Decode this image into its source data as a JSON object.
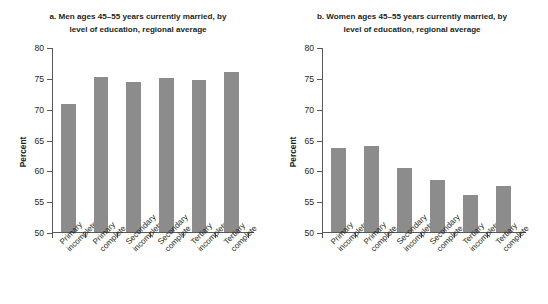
{
  "figure": {
    "super_title": "Latin America and the Caribbean",
    "bar_color": "#8c8c8c",
    "axis_color": "#58585a"
  },
  "panels": [
    {
      "id": "panel-a",
      "title_line1": "a. Men ages 45–55 years currently married, by",
      "title_line2": "level of education, regional average",
      "ylabel": "Percent"
    },
    {
      "id": "panel-b",
      "title_line1": "b. Women ages 45–55 years currently married, by",
      "title_line2": "level of education, regional average",
      "ylabel": "Percent"
    }
  ],
  "chart_data": [
    {
      "type": "bar",
      "title": "a. Men ages 45–55 years currently married, by level of education, regional average",
      "categories": [
        "Primary incomplete",
        "Primary complete",
        "Secondary incomplete",
        "Secondary complete",
        "Tertiary incomplete",
        "Tertiary complete"
      ],
      "category_lines": [
        [
          "Primary",
          "incomplete"
        ],
        [
          "Primary",
          "complete"
        ],
        [
          "Secondary",
          "incomplete"
        ],
        [
          "Secondary",
          "complete"
        ],
        [
          "Tertiary",
          "incomplete"
        ],
        [
          "Tertiary",
          "complete"
        ]
      ],
      "values": [
        70.7,
        75.2,
        74.4,
        75.0,
        74.7,
        76.0
      ],
      "xlabel": "",
      "ylabel": "Percent",
      "ylim": [
        50,
        80
      ],
      "yticks": [
        50,
        55,
        60,
        65,
        70,
        75,
        80
      ],
      "grid": false,
      "legend": false,
      "series_color": "#8c8c8c"
    },
    {
      "type": "bar",
      "title": "b. Women ages 45–55 years currently married, by level of education, regional average",
      "categories": [
        "Primary incomplete",
        "Primary complete",
        "Secondary incomplete",
        "Secondary complete",
        "Tertiary incomplete",
        "Tertiary complete"
      ],
      "category_lines": [
        [
          "Primary",
          "incomplete"
        ],
        [
          "Primary",
          "complete"
        ],
        [
          "Secondary",
          "incomplete"
        ],
        [
          "Secondary",
          "complete"
        ],
        [
          "Tertiary",
          "incomplete"
        ],
        [
          "Tertiary",
          "complete"
        ]
      ],
      "values": [
        63.6,
        64.0,
        60.3,
        58.4,
        56.0,
        57.4
      ],
      "xlabel": "",
      "ylabel": "Percent",
      "ylim": [
        50,
        80
      ],
      "yticks": [
        50,
        55,
        60,
        65,
        70,
        75,
        80
      ],
      "grid": false,
      "legend": false,
      "series_color": "#8c8c8c"
    }
  ]
}
